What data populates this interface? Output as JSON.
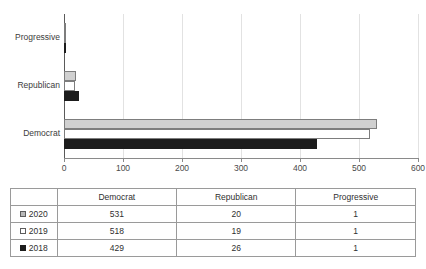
{
  "chart_data": {
    "type": "bar",
    "orientation": "horizontal",
    "grouped": true,
    "title": "",
    "xlabel": "",
    "ylabel": "",
    "categories": [
      "Democrat",
      "Republican",
      "Progressive"
    ],
    "category_order_top_to_bottom": [
      "Progressive",
      "Republican",
      "Democrat"
    ],
    "series": [
      {
        "name": "2020",
        "values": [
          531,
          20,
          1
        ],
        "color": "#d0d0d0",
        "swatch": "gray-filled-square"
      },
      {
        "name": "2019",
        "values": [
          518,
          19,
          1
        ],
        "color": "#ffffff",
        "swatch": "white-empty-square"
      },
      {
        "name": "2018",
        "values": [
          429,
          26,
          1
        ],
        "color": "#1c1c1c",
        "swatch": "black-filled-square"
      }
    ],
    "xlim": [
      0,
      600
    ],
    "xticks": [
      0,
      100,
      200,
      300,
      400,
      500,
      600
    ],
    "xtick_labels": [
      "0",
      "100",
      "200",
      "300",
      "400",
      "500",
      "600"
    ],
    "grid": "vertical-only",
    "legend_position": "table-first-column"
  },
  "table": {
    "corner_label": "",
    "columns": [
      "Democrat",
      "Republican",
      "Progressive"
    ],
    "rows": [
      {
        "series": "2020",
        "swatch": "gray-filled-square",
        "values": [
          "531",
          "20",
          "1"
        ]
      },
      {
        "series": "2019",
        "swatch": "white-empty-square",
        "values": [
          "518",
          "19",
          "1"
        ]
      },
      {
        "series": "2018",
        "swatch": "black-filled-square",
        "values": [
          "429",
          "26",
          "1"
        ]
      }
    ]
  }
}
